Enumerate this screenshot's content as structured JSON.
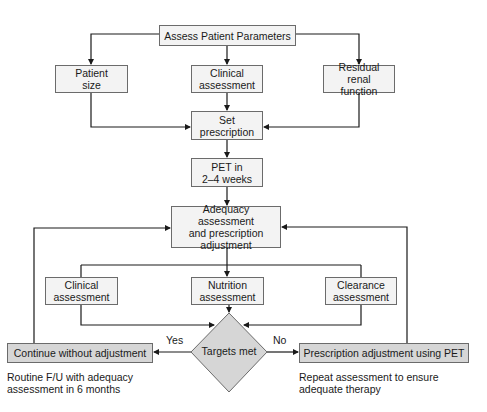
{
  "diagram": {
    "top": "Assess Patient Parameters",
    "inputs": [
      "Patient\nsize",
      "Clinical\nassessment",
      "Residual renal\nfunction"
    ],
    "set_prescription": "Set\nprescription",
    "pet": "PET in\n2–4 weeks",
    "adequacy": "Adequacy assessment\nand prescription\nadjustment",
    "assessments": [
      "Clinical\nassessment",
      "Nutrition\nassessment",
      "Clearance\nassessment"
    ],
    "decision": "Targets met",
    "yes_label": "Yes",
    "no_label": "No",
    "yes_action": "Continue without adjustment",
    "no_action": "Prescription adjustment using PET",
    "yes_note": "Routine F/U with adequacy\nassessment in 6 months",
    "no_note": "Repeat assessment to ensure\nadequate therapy"
  },
  "colors": {
    "box_fill": "#f3f3f3",
    "highlight_fill": "#d6d6d6",
    "line": "#1a1a1a"
  }
}
